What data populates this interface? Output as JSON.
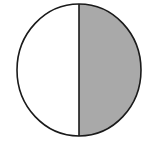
{
  "diagram": {
    "type": "fraction-circle",
    "parts_total": 2,
    "parts_shaded": 1,
    "shaded_side": "right",
    "colors": {
      "background": "#ffffff",
      "unshaded": "#ffffff",
      "shaded": "#a9a9a9",
      "stroke": "#1a1a1a"
    }
  }
}
